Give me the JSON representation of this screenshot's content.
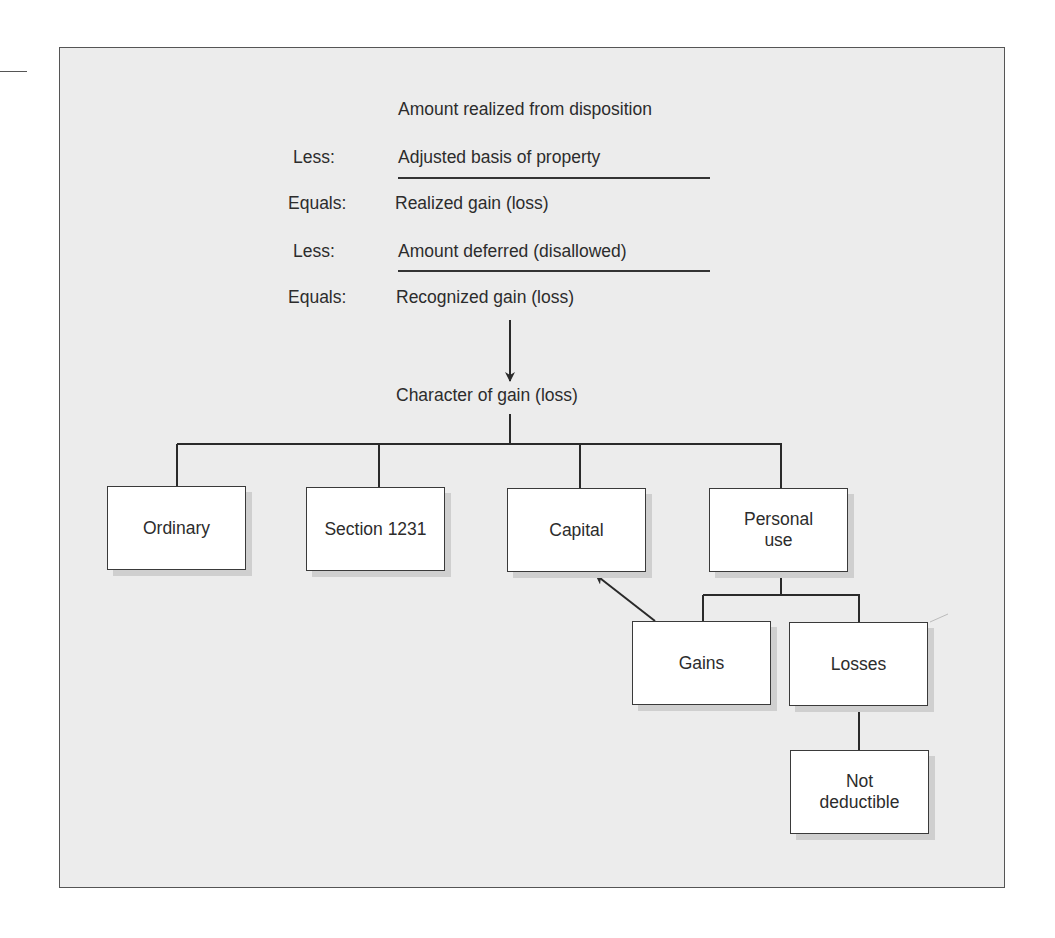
{
  "diagram": {
    "title_line": "Amount realized from disposition",
    "steps": [
      {
        "operator": "Less:",
        "text": "Adjusted basis of property",
        "underlined": true
      },
      {
        "operator": "Equals:",
        "text": "Realized gain (loss)",
        "underlined": false
      },
      {
        "operator": "Less:",
        "text": "Amount deferred (disallowed)",
        "underlined": true
      },
      {
        "operator": "Equals:",
        "text": "Recognized gain (loss)",
        "underlined": false
      }
    ],
    "character_label": "Character of gain (loss)",
    "categories": [
      {
        "label": "Ordinary"
      },
      {
        "label": "Section 1231"
      },
      {
        "label": "Capital"
      },
      {
        "label_line1": "Personal",
        "label_line2": "use"
      }
    ],
    "personal_use_children": [
      {
        "label": "Gains"
      },
      {
        "label": "Losses"
      }
    ],
    "losses_child": {
      "label_line1": "Not",
      "label_line2": "deductible"
    }
  },
  "colors": {
    "frame_background": "#ececec",
    "box_fill": "#ffffff",
    "line": "#333333",
    "shadow": "#cfcfcf"
  }
}
